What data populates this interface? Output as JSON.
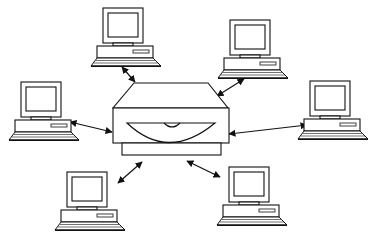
{
  "diagram": {
    "title": "Central server connected to six client computers",
    "colors": {
      "stroke": "#111111",
      "background": "#ffffff"
    },
    "hub": {
      "label": "Server / storage device",
      "icon": "disk-drive-icon"
    },
    "nodes": [
      {
        "id": "computer-top-left",
        "label": "Client computer",
        "icon": "desktop-computer-icon"
      },
      {
        "id": "computer-top-right",
        "label": "Client computer",
        "icon": "desktop-computer-icon"
      },
      {
        "id": "computer-left",
        "label": "Client computer",
        "icon": "desktop-computer-icon"
      },
      {
        "id": "computer-right",
        "label": "Client computer",
        "icon": "desktop-computer-icon"
      },
      {
        "id": "computer-bottom-left",
        "label": "Client computer",
        "icon": "desktop-computer-icon"
      },
      {
        "id": "computer-bottom-right",
        "label": "Client computer",
        "icon": "desktop-computer-icon"
      }
    ],
    "edges": [
      {
        "from": "hub",
        "to": "computer-top-left",
        "type": "bidirectional-arrow"
      },
      {
        "from": "hub",
        "to": "computer-top-right",
        "type": "bidirectional-arrow"
      },
      {
        "from": "hub",
        "to": "computer-left",
        "type": "bidirectional-arrow"
      },
      {
        "from": "hub",
        "to": "computer-right",
        "type": "bidirectional-arrow"
      },
      {
        "from": "hub",
        "to": "computer-bottom-left",
        "type": "bidirectional-arrow"
      },
      {
        "from": "hub",
        "to": "computer-bottom-right",
        "type": "bidirectional-arrow"
      }
    ]
  }
}
